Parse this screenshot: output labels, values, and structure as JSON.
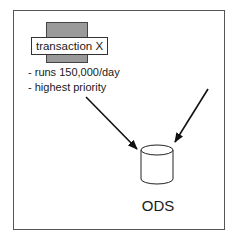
{
  "diagram": {
    "source_node": {
      "label": "transaction X",
      "notes": [
        "- runs 150,000/day",
        "- highest priority"
      ],
      "block_color": "#9a9a9a"
    },
    "target_node": {
      "label": "ODS",
      "shape": "cylinder-icon"
    },
    "edges": [
      {
        "from": "transaction X",
        "to": "ODS"
      },
      {
        "from": "external (off-frame right)",
        "to": "ODS"
      }
    ]
  }
}
